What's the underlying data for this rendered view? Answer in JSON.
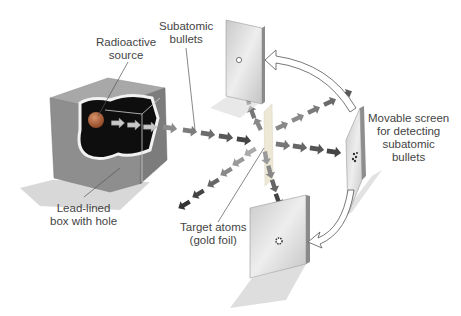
{
  "diagram": {
    "labels": {
      "radioactive_source": [
        "Radioactive",
        "source"
      ],
      "subatomic_bullets": [
        "Subatomic",
        "bullets"
      ],
      "lead_box": [
        "Lead-lined",
        "box with hole"
      ],
      "target_atoms": [
        "Target atoms",
        "(gold foil)"
      ],
      "movable_screen": [
        "Movable screen",
        "for detecting",
        "subatomic",
        "bullets"
      ]
    },
    "colors": {
      "box_face": "#8a8a8a",
      "box_top": "#a5a5a5",
      "box_interior": "#111111",
      "source_ball": "#b8612e",
      "arrow_dark": "#3a3a3a",
      "arrow_mid": "#6e6e6e",
      "arrow_light": "#a8a8a8",
      "screen": "#d6d6d6",
      "foil": "#e8e4d8",
      "leader_line": "#555555"
    }
  }
}
